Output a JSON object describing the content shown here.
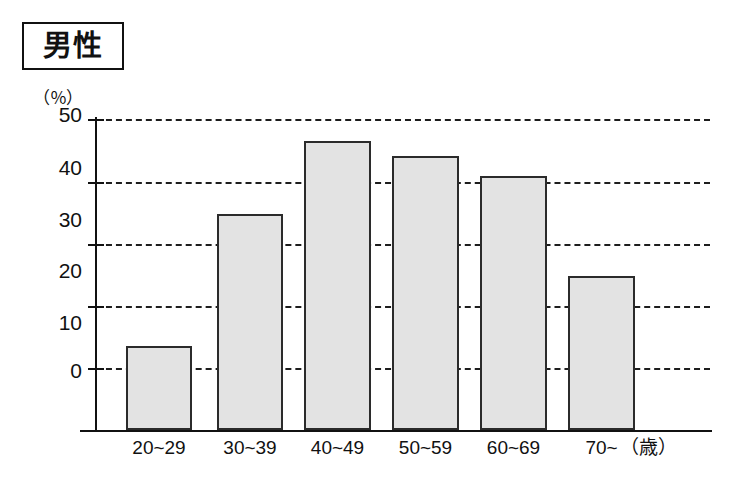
{
  "figure": {
    "title": "男性",
    "unit_label": "（％）",
    "x_unit_label": "（歳）"
  },
  "axis": {
    "y_ticks": [
      "50",
      "40",
      "30",
      "20",
      "10",
      "0"
    ],
    "x_categories": [
      "20~29",
      "30~39",
      "40~49",
      "50~59",
      "60~69",
      "70~"
    ]
  },
  "colors": {
    "bar_fill": "#e3e3e3",
    "bar_stroke": "#2b2b2b",
    "axis": "#111111",
    "gridline": "#1d1d1d",
    "background": "#ffffff"
  },
  "chart_data": {
    "type": "bar",
    "title": "男性",
    "xlabel": "（歳）",
    "ylabel": "（％）",
    "categories": [
      "20~29",
      "30~39",
      "40~49",
      "50~59",
      "60~69",
      "70~"
    ],
    "values": [
      4.5,
      31.0,
      45.5,
      42.5,
      38.5,
      18.5
    ],
    "ylim": [
      0,
      50
    ],
    "ytick_values": [
      0,
      10,
      20,
      30,
      40,
      50
    ],
    "grid": true,
    "legend": "none"
  }
}
